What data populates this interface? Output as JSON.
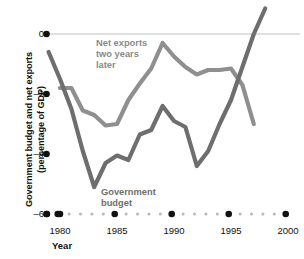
{
  "chart_data": {
    "type": "line",
    "title": "",
    "xlabel": "Year",
    "ylabel_line1": "Government budget and net exports",
    "ylabel_line2": "(percentage of GDP)",
    "xlim": [
      1979,
      2000.5
    ],
    "ylim": [
      -6,
      1
    ],
    "grid": false,
    "zero_line": true,
    "legend_position": "inline-annotations",
    "x_ticks": [
      1980,
      1985,
      1990,
      1995,
      2000
    ],
    "x_tick_labels": [
      "1980",
      "1985",
      "1990",
      "1995",
      "2000"
    ],
    "y_ticks": [
      0,
      -2,
      -4,
      -6
    ],
    "y_tick_labels": [
      "0",
      "–2",
      "–4",
      "–6"
    ],
    "series": [
      {
        "name": "Government budget",
        "color": "#6e6e6e",
        "annotation": "Government budget",
        "x": [
          1979,
          1980,
          1981,
          1982,
          1983,
          1984,
          1985,
          1986,
          1987,
          1988,
          1989,
          1990,
          1991,
          1992,
          1993,
          1994,
          1995,
          1996,
          1997,
          1998
        ],
        "values": [
          -0.6,
          -1.5,
          -2.5,
          -3.9,
          -5.1,
          -4.3,
          -4.05,
          -4.2,
          -3.35,
          -3.2,
          -2.4,
          -2.9,
          -3.1,
          -4.4,
          -3.9,
          -3.0,
          -2.2,
          -1.1,
          0.0,
          0.85
        ]
      },
      {
        "name": "Net exports two years later",
        "color": "#8f8f8f",
        "annotation": "Net exports two years later",
        "x": [
          1980,
          1981,
          1982,
          1983,
          1984,
          1985,
          1986,
          1987,
          1988,
          1989,
          1990,
          1991,
          1992,
          1993,
          1994,
          1995,
          1996,
          1997
        ],
        "values": [
          -1.8,
          -1.8,
          -2.55,
          -2.7,
          -3.05,
          -3.0,
          -2.2,
          -1.65,
          -1.15,
          -0.3,
          -0.75,
          -1.1,
          -1.35,
          -1.2,
          -1.2,
          -1.15,
          -1.7,
          -3.0
        ]
      }
    ]
  },
  "annotations": {
    "net_exports": [
      "Net exports",
      "two years",
      "later"
    ],
    "government_budget": [
      "Government",
      "budget"
    ]
  },
  "colors": {
    "gov_budget_line": "#6e6e6e",
    "net_exports_line": "#8f8f8f",
    "zero_line": "#d5d5d5",
    "axis_dots": "#111111",
    "axis_minor_dots": "#b8b8b8",
    "text": "#111111"
  }
}
